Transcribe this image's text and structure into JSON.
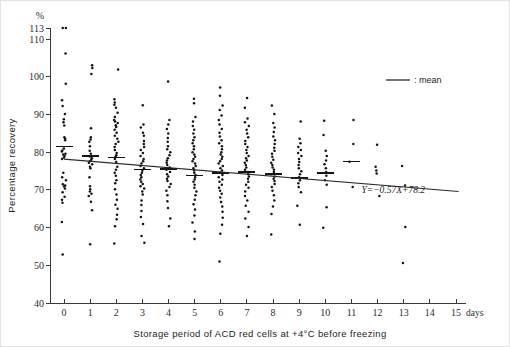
{
  "chart_data": {
    "type": "scatter",
    "title": "",
    "subtitle": "",
    "xlabel": "Storage period of ACD red cells at +4°C before freezing",
    "ylabel": "Percentage recovery",
    "yunit": "%",
    "xunit": "days",
    "xlim": [
      0,
      15
    ],
    "ylim": [
      40,
      113
    ],
    "grid": false,
    "legend_position": "top-right",
    "legend": [
      {
        "marker": "line",
        "label": ": mean"
      }
    ],
    "annotations": [
      {
        "text": "Y=−0.57X+78.2",
        "x": 12.6,
        "y": 69.2
      }
    ],
    "xticks": [
      0,
      1,
      2,
      3,
      4,
      5,
      6,
      7,
      8,
      9,
      10,
      11,
      12,
      13,
      14,
      15
    ],
    "xticklabels": [
      "0",
      "1",
      "2",
      "3",
      "4",
      "5",
      "6",
      "7",
      "8",
      "9",
      "10",
      "11",
      "12",
      "13",
      "14",
      "15"
    ],
    "yticks": [
      40,
      50,
      60,
      70,
      80,
      90,
      100,
      110,
      113
    ],
    "yticklabels": [
      "40",
      "50",
      "60",
      "70",
      "80",
      "90",
      "100",
      "110",
      "113"
    ],
    "regression": {
      "equation": "Y=−0.57X+78.2",
      "slope": -0.57,
      "intercept": 78.2,
      "x_start": 0,
      "x_end": 15.1
    },
    "means": [
      {
        "x": 0,
        "y": 81.5
      },
      {
        "x": 1,
        "y": 79.0
      },
      {
        "x": 2,
        "y": 78.6
      },
      {
        "x": 3,
        "y": 75.4
      },
      {
        "x": 4,
        "y": 75.6
      },
      {
        "x": 5,
        "y": 73.9
      },
      {
        "x": 6,
        "y": 74.5
      },
      {
        "x": 7,
        "y": 74.8
      },
      {
        "x": 8,
        "y": 74.2
      },
      {
        "x": 9,
        "y": 73.2
      },
      {
        "x": 10,
        "y": 74.5
      },
      {
        "x": 11,
        "y": 77.5
      }
    ],
    "series": [
      {
        "name": "Percentage recovery of individual units",
        "points_by_day": [
          {
            "x": 0,
            "values": [
              113.0,
              113.0,
              106.2,
              98.2,
              93.8,
              92.3,
              90.2,
              88.8,
              88.0,
              87.1,
              84.0,
              83.6,
              83.2,
              81.0,
              80.5,
              80.2,
              79.6,
              79.4,
              79.0,
              78.6,
              78.2,
              74.6,
              73.4,
              72.6,
              71.5,
              71.2,
              70.9,
              70.4,
              69.4,
              68.2,
              67.4,
              66.6,
              61.5,
              52.9
            ]
          },
          {
            "x": 1,
            "values": [
              103.1,
              102.4,
              100.8,
              86.4,
              84.0,
              83.4,
              82.8,
              81.6,
              80.4,
              79.6,
              78.9,
              78.4,
              78.0,
              77.6,
              77.2,
              76.8,
              76.2,
              75.8,
              73.4,
              71.0,
              70.2,
              69.6,
              69.0,
              68.4,
              66.9,
              64.6,
              55.6
            ]
          },
          {
            "x": 2,
            "values": [
              102.0,
              94.1,
              93.2,
              92.6,
              91.8,
              90.5,
              89.4,
              88.6,
              88.2,
              87.8,
              87.2,
              86.7,
              86.0,
              85.2,
              84.4,
              83.6,
              82.8,
              82.2,
              81.4,
              80.6,
              79.8,
              79.2,
              78.8,
              78.2,
              77.4,
              76.2,
              75.4,
              74.6,
              73.8,
              72.6,
              71.8,
              70.2,
              68.8,
              67.4,
              66.1,
              65.0,
              63.4,
              62.2,
              60.4,
              55.8
            ]
          },
          {
            "x": 3,
            "values": [
              92.5,
              87.4,
              86.6,
              85.2,
              84.4,
              83.0,
              82.2,
              81.4,
              80.6,
              79.8,
              79.0,
              78.2,
              77.6,
              77.0,
              76.4,
              75.8,
              75.2,
              74.6,
              74.0,
              73.4,
              72.8,
              72.2,
              71.6,
              71.0,
              70.4,
              69.6,
              68.8,
              67.2,
              66.0,
              64.4,
              62.8,
              61.0,
              57.8,
              56.0
            ]
          },
          {
            "x": 4,
            "values": [
              98.8,
              88.6,
              87.4,
              86.2,
              85.0,
              83.8,
              82.8,
              81.6,
              80.8,
              80.0,
              79.2,
              78.4,
              77.8,
              77.2,
              76.6,
              76.0,
              75.4,
              74.8,
              74.2,
              73.6,
              73.0,
              72.4,
              71.6,
              70.8,
              69.8,
              68.6,
              67.0,
              65.2,
              62.4,
              60.4
            ]
          },
          {
            "x": 5,
            "values": [
              94.2,
              93.0,
              89.4,
              88.2,
              87.0,
              86.0,
              85.0,
              84.0,
              83.2,
              82.4,
              81.6,
              80.8,
              80.0,
              79.4,
              78.8,
              78.2,
              77.6,
              77.0,
              76.4,
              75.8,
              75.2,
              74.6,
              74.0,
              73.4,
              72.8,
              72.2,
              71.4,
              70.6,
              69.6,
              68.6,
              67.4,
              66.2,
              64.8,
              63.2,
              61.4,
              59.0,
              57.0
            ]
          },
          {
            "x": 6,
            "values": [
              97.2,
              95.0,
              92.4,
              91.2,
              89.8,
              88.6,
              87.4,
              86.2,
              85.2,
              84.2,
              83.2,
              82.4,
              81.6,
              80.8,
              80.0,
              79.4,
              78.8,
              78.2,
              77.6,
              77.0,
              76.4,
              75.8,
              75.2,
              74.6,
              74.0,
              73.4,
              72.8,
              72.2,
              71.4,
              70.6,
              69.8,
              69.0,
              68.0,
              66.8,
              65.6,
              64.2,
              62.6,
              60.8,
              58.4,
              51.0
            ]
          },
          {
            "x": 7,
            "values": [
              94.4,
              91.8,
              89.0,
              88.0,
              87.0,
              86.0,
              85.0,
              84.0,
              83.0,
              82.2,
              81.4,
              80.6,
              79.8,
              79.0,
              78.4,
              77.8,
              77.2,
              76.6,
              76.0,
              75.4,
              74.8,
              74.2,
              73.6,
              73.0,
              72.2,
              71.4,
              70.6,
              69.6,
              68.4,
              67.2,
              65.8,
              64.2,
              62.4,
              60.2,
              57.8
            ]
          },
          {
            "x": 8,
            "values": [
              92.4,
              90.2,
              87.8,
              86.6,
              85.4,
              84.2,
              83.2,
              82.2,
              81.2,
              80.4,
              79.6,
              78.8,
              78.0,
              77.2,
              76.6,
              76.0,
              75.4,
              74.8,
              74.2,
              73.6,
              73.0,
              72.4,
              71.6,
              70.8,
              69.8,
              68.6,
              67.2,
              65.6,
              63.6,
              58.2
            ]
          },
          {
            "x": 9,
            "values": [
              88.2,
              83.6,
              82.4,
              81.4,
              80.6,
              79.8,
              79.0,
              78.2,
              77.4,
              76.6,
              75.8,
              75.0,
              74.2,
              73.4,
              72.6,
              71.8,
              70.8,
              69.4,
              65.8,
              60.8
            ]
          },
          {
            "x": 10,
            "values": [
              88.4,
              84.6,
              80.4,
              79.0,
              77.8,
              76.8,
              75.8,
              74.8,
              73.8,
              72.6,
              71.4,
              65.4,
              60.0
            ]
          },
          {
            "x": 11,
            "values": [
              88.6,
              82.2,
              77.5,
              70.8
            ]
          },
          {
            "x": 12,
            "values": [
              82.0,
              76.2,
              75.2,
              74.4,
              68.4
            ]
          },
          {
            "x": 13,
            "values": [
              76.4,
              71.2,
              60.2,
              50.6
            ]
          }
        ]
      }
    ]
  },
  "legend": {
    "mean_label": ": mean"
  },
  "equation": {
    "text": "Y=−0.57X+78.2"
  },
  "axes": {
    "y_unit": "%",
    "x_unit": "days",
    "y_title": "Percentage recovery",
    "x_title": "Storage period of ACD red cells at +4°C before freezing"
  }
}
